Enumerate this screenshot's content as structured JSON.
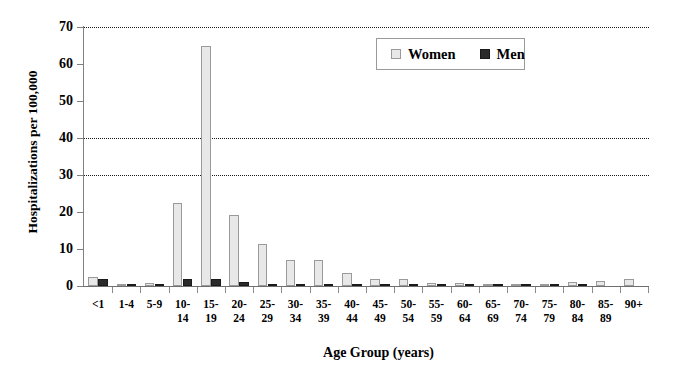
{
  "chart_data": {
    "type": "bar",
    "title": "",
    "xlabel": "Age Group (years)",
    "ylabel": "Hospitalizations per 100,000",
    "categories": [
      "<1",
      "1-4",
      "5-9",
      "10-14",
      "15-19",
      "20-24",
      "25-29",
      "30-34",
      "35-39",
      "40-44",
      "45-49",
      "50-54",
      "55-59",
      "60-64",
      "65-69",
      "70-74",
      "75-79",
      "80-84",
      "85-89",
      "90+"
    ],
    "category_lines": [
      [
        "<1"
      ],
      [
        "1-4"
      ],
      [
        "5-9"
      ],
      [
        "10-",
        "14"
      ],
      [
        "15-",
        "19"
      ],
      [
        "20-",
        "24"
      ],
      [
        "25-",
        "29"
      ],
      [
        "30-",
        "34"
      ],
      [
        "35-",
        "39"
      ],
      [
        "40-",
        "44"
      ],
      [
        "45-",
        "49"
      ],
      [
        "50-",
        "54"
      ],
      [
        "55-",
        "59"
      ],
      [
        "60-",
        "64"
      ],
      [
        "65-",
        "69"
      ],
      [
        "70-",
        "74"
      ],
      [
        "75-",
        "79"
      ],
      [
        "80-",
        "84"
      ],
      [
        "85-",
        "89"
      ],
      [
        "90+"
      ]
    ],
    "series": [
      {
        "name": "Women",
        "color": "#e8e8e8",
        "values": [
          2.5,
          0.3,
          0.8,
          22.4,
          65.0,
          19.2,
          11.4,
          7.0,
          7.1,
          3.5,
          1.9,
          1.8,
          0.9,
          0.9,
          0.4,
          0.3,
          0.4,
          1.2,
          1.3,
          1.8
        ]
      },
      {
        "name": "Men",
        "color": "#2b2b2b",
        "values": [
          2.0,
          0.3,
          0.5,
          2.0,
          2.0,
          1.0,
          0.5,
          0.5,
          0.4,
          0.4,
          0.2,
          0.2,
          0.2,
          0.2,
          0.3,
          0.6,
          0.3,
          0.6,
          0.0,
          0.0
        ]
      }
    ],
    "ylim": [
      0,
      70
    ],
    "yticks": [
      0,
      10,
      20,
      30,
      40,
      50,
      60,
      70
    ],
    "ytick_labels": [
      "0",
      "10",
      "20",
      "30",
      "40",
      "50",
      "60",
      "70"
    ],
    "gridlines": [
      30,
      40,
      70
    ],
    "grid": "horizontal-dotted-partial",
    "legend_position": "top-right-inside",
    "legend": [
      "Women",
      "Men"
    ]
  }
}
